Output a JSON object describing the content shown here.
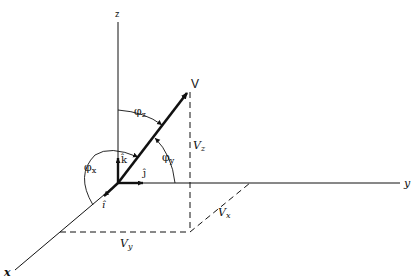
{
  "diagram": {
    "axes": {
      "z": {
        "label": "z"
      },
      "y": {
        "label": "y"
      },
      "x": {
        "label": "x"
      }
    },
    "vector": {
      "label": "V"
    },
    "unit_vectors": {
      "i": "î",
      "j": "ĵ",
      "k": "k̂"
    },
    "angles": {
      "phi_x": {
        "symbol": "φ",
        "sub": "x"
      },
      "phi_y": {
        "symbol": "φ",
        "sub": "y"
      },
      "phi_z": {
        "symbol": "φ",
        "sub": "z"
      }
    },
    "components": {
      "Vx": {
        "symbol": "V",
        "sub": "x"
      },
      "Vy": {
        "symbol": "V",
        "sub": "y"
      },
      "Vz": {
        "symbol": "V",
        "sub": "z"
      }
    },
    "colors": {
      "ink": "#111111",
      "background": "#ffffff"
    }
  }
}
